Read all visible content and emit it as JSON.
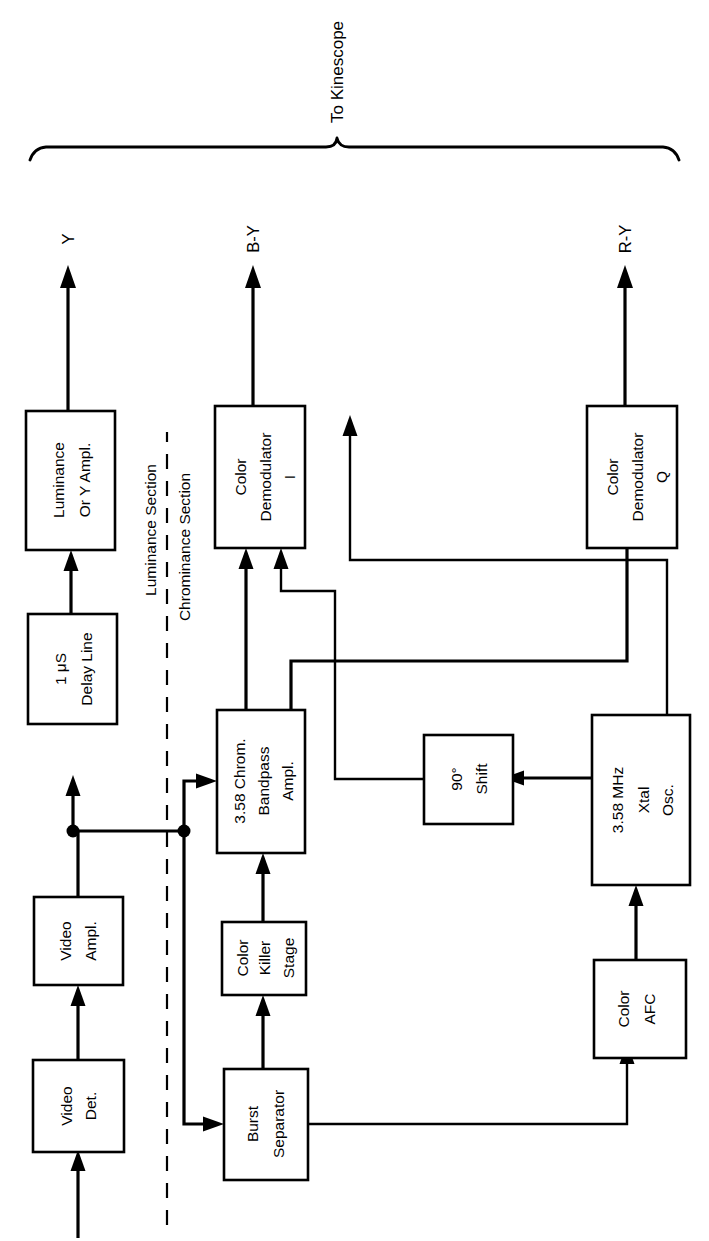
{
  "figure": {
    "orientation": "rotated-90-ccw",
    "ink_color": "#000000",
    "background_color": "#ffffff"
  },
  "blocks": {
    "video_det": "Video\nDet.",
    "video_det_line1": "Video",
    "video_det_line2": "Det.",
    "video_ampl_line1": "Video",
    "video_ampl_line2": "Ampl.",
    "delay_line1": "1 μS",
    "delay_line2": "Delay Line",
    "luminance_line1": "Luminance",
    "luminance_line2": "Or Y Ampl.",
    "burst_line1": "Burst",
    "burst_line2": "Separator",
    "killer_line1": "Color",
    "killer_line2": "Killer",
    "killer_line3": "Stage",
    "bandpass_line1": "3.58 Chrom.",
    "bandpass_line2": "Bandpass",
    "bandpass_line3": "Ampl.",
    "demod_i_line1": "Color",
    "demod_i_line2": "Demodulator",
    "demod_i_line3": "I",
    "demod_q_line1": "Color",
    "demod_q_line2": "Demodulator",
    "demod_q_line3": "Q",
    "shift_line1": "90°",
    "shift_line2": "Shift",
    "xtal_line1": "3.58 MHz",
    "xtal_line2": "Xtal",
    "xtal_line3": "Osc.",
    "afc_line1": "Color",
    "afc_line2": "AFC"
  },
  "signals": {
    "y_out": "Y",
    "by_out": "B-Y",
    "ry_out": "R-Y"
  },
  "sections": {
    "luminance": "Luminance Section",
    "chrominance": "Chrominance Section"
  },
  "annotations": {
    "to_kinescope": "To Kinescope"
  }
}
